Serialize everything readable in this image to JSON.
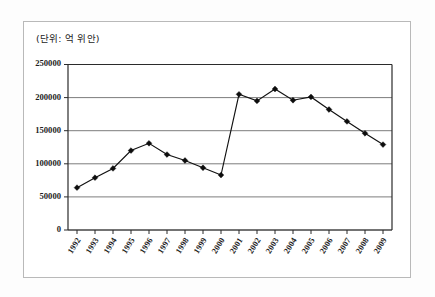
{
  "figure": {
    "unit_label": "(단위: 억 위안)",
    "frame_color": "#b9b9b9",
    "background": "#ffffff"
  },
  "chart_data": {
    "type": "line",
    "title": "",
    "subtitle": "",
    "xlabel": "",
    "ylabel": "",
    "unit_note": "(단위: 억 위안)",
    "grid": true,
    "legend": "none",
    "marker": "diamond",
    "line_color": "#111111",
    "marker_color": "#0d0d0d",
    "ylim": [
      0,
      250000
    ],
    "yticks": [
      0,
      50000,
      100000,
      150000,
      200000,
      250000
    ],
    "ytick_labels": [
      "0",
      "50000",
      "100000",
      "150000",
      "200000",
      "250000"
    ],
    "categories": [
      "1992",
      "1993",
      "1994",
      "1995",
      "1996",
      "1997",
      "1998",
      "1999",
      "2000",
      "2001",
      "2002",
      "2003",
      "2004",
      "2005",
      "2006",
      "2007",
      "2008",
      "2009"
    ],
    "values": [
      64000,
      79000,
      93000,
      120000,
      131000,
      114000,
      105000,
      94000,
      83000,
      205000,
      195000,
      213000,
      196000,
      201000,
      182000,
      164000,
      146000,
      129000
    ],
    "series": [
      {
        "name": "series-1",
        "values": [
          64000,
          79000,
          93000,
          120000,
          131000,
          114000,
          105000,
          94000,
          83000,
          205000,
          195000,
          213000,
          196000,
          201000,
          182000,
          164000,
          146000,
          129000
        ]
      }
    ]
  }
}
